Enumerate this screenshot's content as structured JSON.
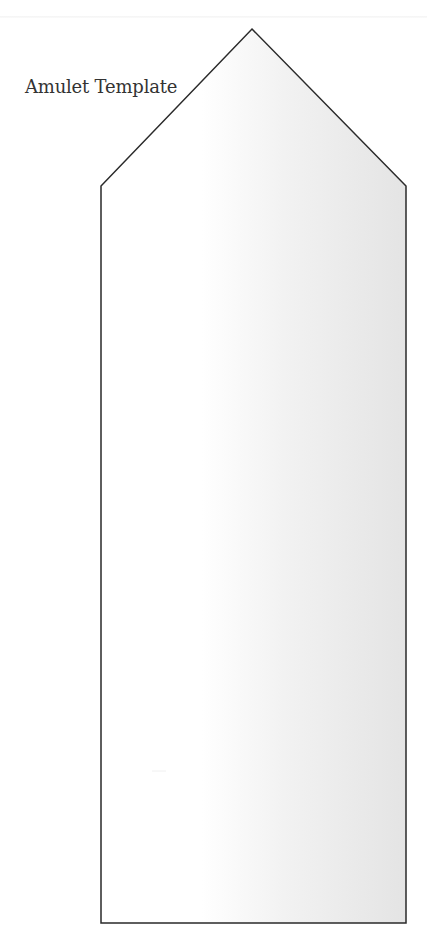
{
  "document": {
    "title": "Amulet Template"
  },
  "shape": {
    "name": "amulet-outline",
    "points": {
      "peak": [
        252,
        29
      ],
      "left_shoulder": [
        101,
        186
      ],
      "right_shoulder": [
        406,
        186
      ],
      "bottom_right": [
        406,
        923
      ],
      "bottom_left": [
        101,
        923
      ]
    },
    "stroke_color": "#2a2a2a",
    "stroke_width": 1.5,
    "fill_gradient": {
      "start_color": "#ffffff",
      "end_color": "#e4e4e4",
      "start_x_fraction": 0.33
    }
  },
  "colors": {
    "background": "#ffffff",
    "text": "#333333",
    "page_edge": "#f4f4f4"
  }
}
